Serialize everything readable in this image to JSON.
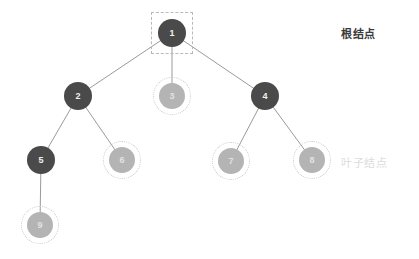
{
  "diagram": {
    "colors": {
      "internal_node": "#4a4a4a",
      "leaf_node": "#b4b4b4",
      "edge": "#9a9a9a",
      "dashed_ring": "#c9c9c9",
      "root_label": "#3b3b3b",
      "leaf_label": "#dcdcdc",
      "background": "#ffffff"
    },
    "nodes": [
      {
        "id": "n1",
        "label": "1",
        "x": 172,
        "y": 33,
        "r": 14,
        "kind": "dark",
        "highlight": "square"
      },
      {
        "id": "n2",
        "label": "2",
        "x": 78,
        "y": 96,
        "r": 14,
        "kind": "dark",
        "highlight": "none"
      },
      {
        "id": "n3",
        "label": "3",
        "x": 172,
        "y": 96,
        "r": 13,
        "kind": "light",
        "highlight": "circle"
      },
      {
        "id": "n4",
        "label": "4",
        "x": 265,
        "y": 96,
        "r": 14,
        "kind": "dark",
        "highlight": "none"
      },
      {
        "id": "n5",
        "label": "5",
        "x": 41,
        "y": 160,
        "r": 14,
        "kind": "dark",
        "highlight": "none"
      },
      {
        "id": "n6",
        "label": "6",
        "x": 122,
        "y": 160,
        "r": 13,
        "kind": "light",
        "highlight": "circle"
      },
      {
        "id": "n7",
        "label": "7",
        "x": 231,
        "y": 161,
        "r": 13,
        "kind": "light",
        "highlight": "circle"
      },
      {
        "id": "n8",
        "label": "8",
        "x": 312,
        "y": 160,
        "r": 13,
        "kind": "light",
        "highlight": "circle"
      },
      {
        "id": "n9",
        "label": "9",
        "x": 40,
        "y": 225,
        "r": 13,
        "kind": "light",
        "highlight": "circle"
      }
    ],
    "edges": [
      {
        "from": "n1",
        "to": "n2"
      },
      {
        "from": "n1",
        "to": "n3"
      },
      {
        "from": "n1",
        "to": "n4"
      },
      {
        "from": "n2",
        "to": "n5"
      },
      {
        "from": "n2",
        "to": "n6"
      },
      {
        "from": "n4",
        "to": "n7"
      },
      {
        "from": "n4",
        "to": "n8"
      },
      {
        "from": "n5",
        "to": "n9"
      }
    ],
    "annotations": [
      {
        "id": "root-label",
        "text": "根结点",
        "x": 341,
        "y": 25,
        "style": "root"
      },
      {
        "id": "leaf-label",
        "text": "叶子结点",
        "x": 341,
        "y": 154,
        "style": "leaf"
      }
    ]
  }
}
